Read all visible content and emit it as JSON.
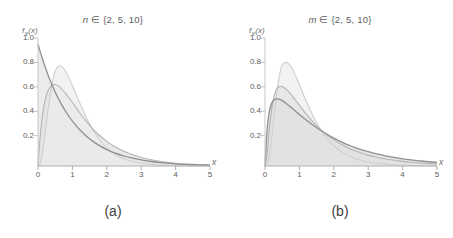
{
  "figure": {
    "background_color": "#ffffff",
    "axis_color": "#b3b3b3",
    "text_color": "#5d5d5d"
  },
  "panels": [
    {
      "id": "a",
      "title_var": "n",
      "title_rest": " ∈ {2, 5, 10}",
      "caption": "(a)",
      "ylabel_main": "f",
      "ylabel_sub": "X",
      "ylabel_arg": "(x)",
      "xlabel": "x",
      "yticks": [
        "1.0",
        "0.8",
        "0.6",
        "0.4",
        "0.2"
      ],
      "xticks": [
        "0",
        "1",
        "2",
        "3",
        "4",
        "5"
      ]
    },
    {
      "id": "b",
      "title_var": "m",
      "title_rest": " ∈ {2, 5, 10}",
      "caption": "(b)",
      "ylabel_main": "f",
      "ylabel_sub": "X",
      "ylabel_arg": "(x)",
      "xlabel": "x",
      "yticks": [
        "1.0",
        "0.8",
        "0.6",
        "0.4",
        "0.2"
      ],
      "xticks": [
        "0",
        "1",
        "2",
        "3",
        "4",
        "5"
      ]
    }
  ],
  "chart_data": [
    {
      "type": "line",
      "panel": "a",
      "title": "n ∈ {2, 5, 10}",
      "xlabel": "x",
      "ylabel": "f_X(x)",
      "xlim": [
        0,
        5
      ],
      "ylim": [
        0,
        1.05
      ],
      "grid": false,
      "legend": "none",
      "filled": true,
      "fill_color": "#e6e6e6",
      "x": [
        0,
        0.05,
        0.1,
        0.15,
        0.2,
        0.25,
        0.3,
        0.35,
        0.4,
        0.45,
        0.5,
        0.6,
        0.7,
        0.8,
        0.9,
        1.0,
        1.2,
        1.4,
        1.6,
        1.8,
        2.0,
        2.25,
        2.5,
        2.75,
        3.0,
        3.25,
        3.5,
        3.75,
        4.0,
        4.25,
        4.5,
        4.75,
        5.0
      ],
      "series": [
        {
          "name": "n = 2",
          "color": "#8f8f8f",
          "peak_x": 0.0,
          "peak_y": 1.0,
          "values": [
            1.0,
            0.951,
            0.905,
            0.861,
            0.819,
            0.779,
            0.741,
            0.705,
            0.67,
            0.638,
            0.607,
            0.549,
            0.497,
            0.449,
            0.407,
            0.368,
            0.301,
            0.247,
            0.202,
            0.165,
            0.135,
            0.105,
            0.082,
            0.064,
            0.05,
            0.039,
            0.03,
            0.024,
            0.018,
            0.014,
            0.011,
            0.009,
            0.007
          ]
        },
        {
          "name": "n = 5",
          "color": "#b4b4b4",
          "peak_x": 0.45,
          "peak_y": 0.68,
          "values": [
            0.0,
            0.196,
            0.344,
            0.452,
            0.53,
            0.585,
            0.622,
            0.646,
            0.66,
            0.667,
            0.668,
            0.655,
            0.629,
            0.596,
            0.559,
            0.521,
            0.441,
            0.368,
            0.303,
            0.248,
            0.202,
            0.156,
            0.12,
            0.092,
            0.07,
            0.053,
            0.04,
            0.03,
            0.023,
            0.017,
            0.013,
            0.01,
            0.007
          ]
        },
        {
          "name": "n = 10",
          "color": "#cfcfcf",
          "peak_x": 0.76,
          "peak_y": 0.82,
          "values": [
            0.0,
            0.012,
            0.061,
            0.146,
            0.253,
            0.368,
            0.478,
            0.577,
            0.661,
            0.729,
            0.78,
            0.82,
            0.815,
            0.779,
            0.725,
            0.661,
            0.526,
            0.4,
            0.294,
            0.211,
            0.149,
            0.094,
            0.059,
            0.036,
            0.022,
            0.013,
            0.008,
            0.005,
            0.003,
            0.002,
            0.001,
            0.001,
            0.0
          ]
        }
      ]
    },
    {
      "type": "line",
      "panel": "b",
      "title": "m ∈ {2, 5, 10}",
      "xlabel": "x",
      "ylabel": "f_X(x)",
      "xlim": [
        0,
        5
      ],
      "ylim": [
        0,
        1.05
      ],
      "grid": false,
      "legend": "none",
      "filled": true,
      "fill_color": "#e6e6e6",
      "x": [
        0,
        0.05,
        0.1,
        0.15,
        0.2,
        0.25,
        0.3,
        0.35,
        0.4,
        0.45,
        0.5,
        0.6,
        0.7,
        0.8,
        0.9,
        1.0,
        1.2,
        1.4,
        1.6,
        1.8,
        2.0,
        2.25,
        2.5,
        2.75,
        3.0,
        3.25,
        3.5,
        3.75,
        4.0,
        4.25,
        4.5,
        4.75,
        5.0
      ],
      "series": [
        {
          "name": "m = 2",
          "color": "#8f8f8f",
          "peak_x": 0.38,
          "peak_y": 0.55,
          "values": [
            0.0,
            0.25,
            0.4,
            0.478,
            0.519,
            0.539,
            0.548,
            0.55,
            0.548,
            0.543,
            0.536,
            0.517,
            0.495,
            0.471,
            0.447,
            0.423,
            0.377,
            0.334,
            0.295,
            0.26,
            0.229,
            0.194,
            0.164,
            0.139,
            0.117,
            0.099,
            0.083,
            0.07,
            0.059,
            0.05,
            0.042,
            0.035,
            0.03
          ]
        },
        {
          "name": "m = 5",
          "color": "#b4b4b4",
          "peak_x": 0.55,
          "peak_y": 0.655,
          "values": [
            0.0,
            0.07,
            0.22,
            0.366,
            0.476,
            0.554,
            0.606,
            0.635,
            0.65,
            0.654,
            0.652,
            0.634,
            0.606,
            0.572,
            0.535,
            0.498,
            0.425,
            0.36,
            0.303,
            0.255,
            0.214,
            0.172,
            0.138,
            0.111,
            0.089,
            0.072,
            0.058,
            0.047,
            0.038,
            0.031,
            0.025,
            0.02,
            0.017
          ]
        },
        {
          "name": "m = 10",
          "color": "#cfcfcf",
          "peak_x": 0.72,
          "peak_y": 0.85,
          "values": [
            0.0,
            0.004,
            0.04,
            0.125,
            0.243,
            0.376,
            0.503,
            0.617,
            0.711,
            0.784,
            0.832,
            0.85,
            0.836,
            0.794,
            0.735,
            0.668,
            0.531,
            0.409,
            0.307,
            0.227,
            0.166,
            0.112,
            0.075,
            0.05,
            0.033,
            0.022,
            0.015,
            0.01,
            0.007,
            0.005,
            0.003,
            0.002,
            0.001
          ]
        }
      ]
    }
  ]
}
